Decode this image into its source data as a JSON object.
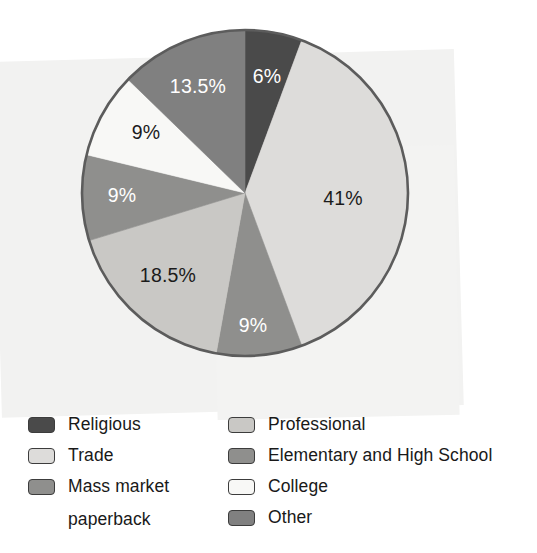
{
  "chart_data": {
    "type": "pie",
    "title": "",
    "subtitle": "",
    "xlabel": "",
    "ylabel": "",
    "grid": false,
    "legend_position": "bottom",
    "start_angle_deg": 0,
    "direction": "clockwise",
    "total_percent": 106,
    "categories": [
      "Religious",
      "Trade",
      "Elementary and High School",
      "Professional",
      "Mass market paperback",
      "College",
      "Other"
    ],
    "values": [
      6,
      41,
      9,
      18.5,
      9,
      9,
      13.5
    ],
    "slices": [
      {
        "name": "Religious",
        "value": 6,
        "data_label": "6%",
        "color": "#4a4a4a",
        "label_color": "#ffffff",
        "label_x": 267,
        "label_y": 78
      },
      {
        "name": "Trade",
        "value": 41,
        "data_label": "41%",
        "color": "#dddcda",
        "label_color": "#1b1b1b",
        "label_x": 343,
        "label_y": 200
      },
      {
        "name": "Elementary and High School",
        "value": 9,
        "data_label": "9%",
        "color": "#8f8f8d",
        "label_color": "#ffffff",
        "label_x": 253,
        "label_y": 327
      },
      {
        "name": "Professional",
        "value": 18.5,
        "data_label": "18.5%",
        "color": "#c9c8c5",
        "label_color": "#1b1b1b",
        "label_x": 168,
        "label_y": 277
      },
      {
        "name": "Mass market paperback",
        "value": 9,
        "data_label": "9%",
        "color": "#8f8f8d",
        "label_color": "#ffffff",
        "label_x": 122,
        "label_y": 197
      },
      {
        "name": "College",
        "value": 9,
        "data_label": "9%",
        "color": "#f8f8f6",
        "label_color": "#1b1b1b",
        "label_x": 146,
        "label_y": 134
      },
      {
        "name": "Other",
        "value": 13.5,
        "data_label": "13.5%",
        "color": "#808080",
        "label_color": "#ffffff",
        "label_x": 198,
        "label_y": 88
      }
    ],
    "outline_color": "#5c5c5c",
    "center": {
      "x": 245,
      "y": 193
    },
    "radius": 163
  },
  "legend": {
    "left_column": [
      {
        "label": "Religious",
        "color": "#4a4a4a"
      },
      {
        "label": "Trade",
        "color": "#dddcda"
      },
      {
        "label": "Mass market",
        "color": "#8f8f8d"
      },
      {
        "label": "paperback",
        "color": ""
      }
    ],
    "right_column": [
      {
        "label": "Professional",
        "color": "#c9c8c5"
      },
      {
        "label": "Elementary and High School",
        "color": "#8f8f8d"
      },
      {
        "label": "College",
        "color": "#f8f8f6"
      },
      {
        "label": "Other",
        "color": "#808080"
      }
    ]
  }
}
